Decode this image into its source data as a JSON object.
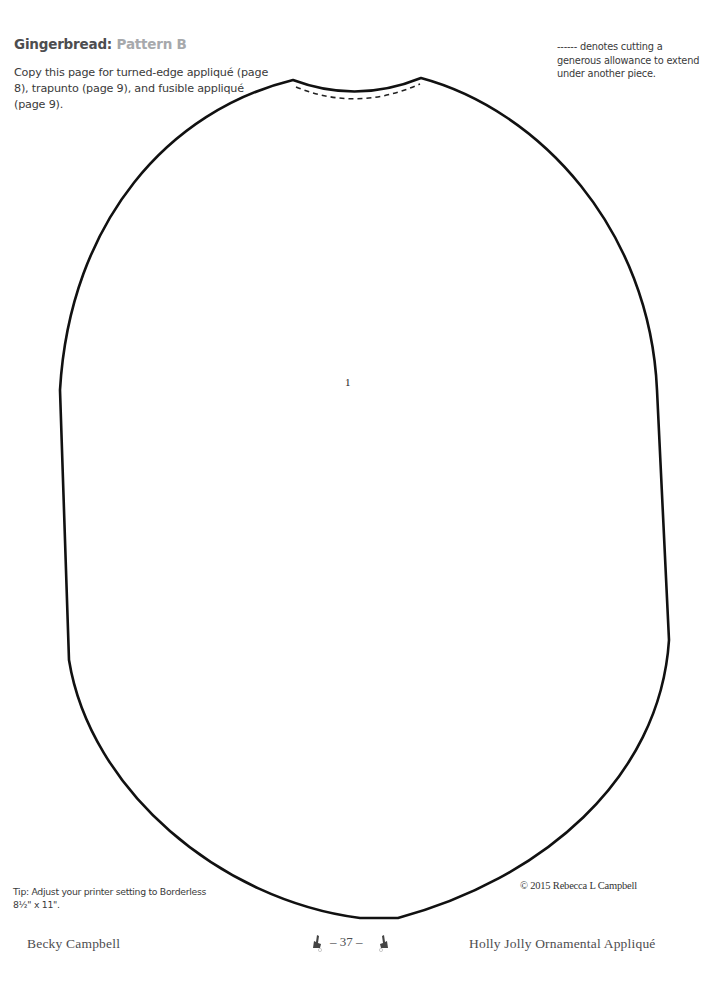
{
  "header": {
    "title_main": "Gingerbread:",
    "title_sub": "Pattern B",
    "intro": "Copy this page for turned-edge appliqué (page 8), trapunto (page 9), and fusible appliqué (page 9).",
    "note": "------ denotes cutting a generous allowance to extend under another piece."
  },
  "pattern": {
    "piece_number": "1",
    "outline_color": "#111111",
    "dashed_line": "cutting allowance"
  },
  "bottom": {
    "tip": "Tip: Adjust your printer setting to Borderless 8½\" x 11\".",
    "copyright": "© 2015 Rebecca L Campbell"
  },
  "footer": {
    "author": "Becky Campbell",
    "page_number": "– 37 –",
    "book_title": "Holly Jolly Ornamental Appliqué",
    "left_icon": "holly-icon",
    "right_icon": "holly-icon"
  }
}
